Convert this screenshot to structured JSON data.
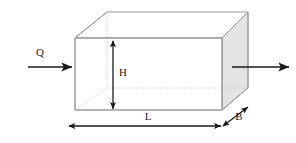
{
  "figure": {
    "type": "engineering-diagram",
    "background_color": "#ffffff"
  },
  "labels": {
    "inflow": "Q",
    "height": "H",
    "length": "L",
    "breadth": "B"
  },
  "colors": {
    "box_face_shaded": "#e3e3e3",
    "box_edge": "#9a9a9a",
    "hidden_edge": "#c2c2c2",
    "arrow": "#1a1a1a",
    "text": "#1a1a1a"
  },
  "geometry": {
    "front_face": {
      "top_left": [
        75,
        38
      ],
      "top_right": [
        222,
        38
      ],
      "bottom_right": [
        222,
        110
      ],
      "bottom_left": [
        75,
        110
      ]
    },
    "back_face": {
      "top_left": [
        107,
        12
      ],
      "top_right": [
        248,
        12
      ],
      "bottom_right": [
        248,
        88
      ],
      "bottom_left": [
        107,
        88
      ]
    },
    "depth_offset": [
      26,
      -26
    ]
  },
  "annotations": {
    "inflow_arrow": {
      "from": [
        28,
        67
      ],
      "to": [
        73,
        67
      ],
      "label_pos": [
        40,
        53
      ]
    },
    "outflow_arrow": {
      "from": [
        232,
        67
      ],
      "to": [
        290,
        67
      ]
    },
    "height_dimension": {
      "from": [
        113,
        40
      ],
      "to": [
        113,
        110
      ],
      "label_pos": [
        122,
        73
      ]
    },
    "length_dimension": {
      "from": [
        68,
        126
      ],
      "to": [
        222,
        126
      ],
      "label_pos": [
        148,
        117
      ]
    },
    "breadth_dimension": {
      "from": [
        222,
        127
      ],
      "to": [
        249,
        106
      ],
      "label_pos": [
        240,
        117
      ]
    }
  }
}
